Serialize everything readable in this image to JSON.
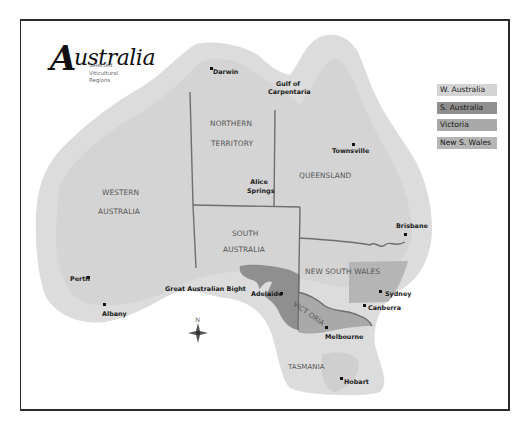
{
  "title": {
    "main": "Australia",
    "initial": "A",
    "rest": "ustralia",
    "subtitle_lines": [
      "Selected",
      "Viticultural",
      "Regions"
    ]
  },
  "legend": [
    {
      "label": "W. Australia",
      "color": "#d4d4d4"
    },
    {
      "label": "S. Australia",
      "color": "#8f8f8f"
    },
    {
      "label": "Victoria",
      "color": "#a9a9a9"
    },
    {
      "label": "New S. Wales",
      "color": "#b5b5b5"
    }
  ],
  "colors": {
    "land": "#dcdcdc",
    "land_inner": "#d2d2d2",
    "border_lines": "#6e6e6e",
    "south_australia_region": "#8f8f8f",
    "victoria_region": "#a9a9a9",
    "nsw_region": "#b5b5b5",
    "frame": "#2a2a2a"
  },
  "states": [
    {
      "id": "western-australia",
      "lines": [
        "WESTERN",
        "AUSTRALIA"
      ]
    },
    {
      "id": "northern-territory",
      "lines": [
        "NORTHERN",
        "TERRITORY"
      ]
    },
    {
      "id": "queensland",
      "lines": [
        "QUEENSLAND"
      ]
    },
    {
      "id": "south-australia",
      "lines": [
        "SOUTH",
        "AUSTRALIA"
      ]
    },
    {
      "id": "new-south-wales",
      "lines": [
        "NEW SOUTH WALES"
      ]
    },
    {
      "id": "victoria",
      "lines": [
        "VICT ORIA"
      ]
    },
    {
      "id": "tasmania",
      "lines": [
        "TASMANIA"
      ]
    }
  ],
  "places": {
    "darwin": "Darwin",
    "gulf_line1": "Gulf of",
    "gulf_line2": "Carpentaria",
    "townsville": "Townsville",
    "alice_line1": "Alice",
    "alice_line2": "Springs",
    "brisbane": "Brisbane",
    "sydney": "Sydney",
    "canberra": "Canberra",
    "melbourne": "Melbourne",
    "adelaide": "Adelaide",
    "hobart": "Hobart",
    "perth": "Perth",
    "albany": "Albany",
    "bight": "Great Australian Bight"
  },
  "compass": {
    "label": "N"
  }
}
